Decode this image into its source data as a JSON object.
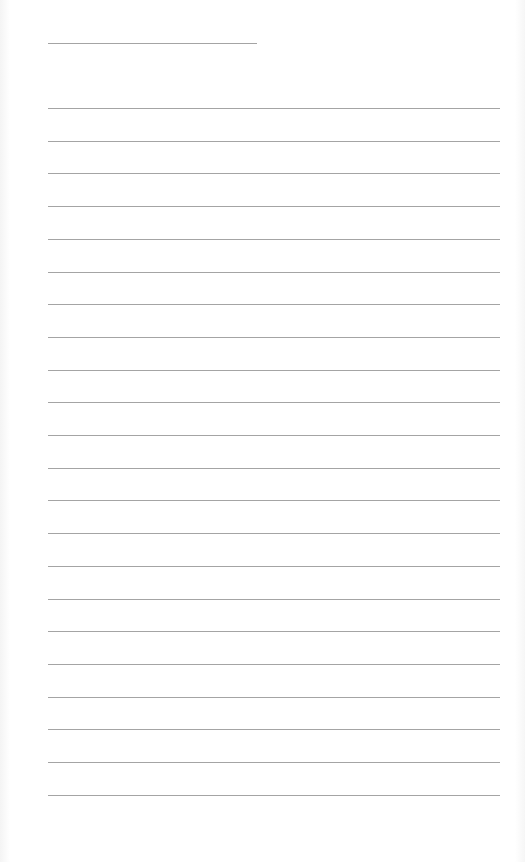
{
  "page": {
    "type": "lined-paper",
    "header_line_count": 1,
    "ruled_line_count": 22,
    "line_color": "#a4a4a4",
    "background_color": "#ffffff"
  }
}
